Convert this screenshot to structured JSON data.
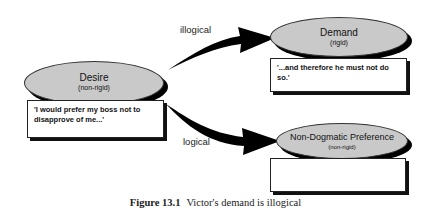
{
  "diagram": {
    "nodes": {
      "desire": {
        "title": "Desire",
        "subtitle": "(non-rigid)",
        "quote": "'I would prefer my boss not to disapprove of me...'"
      },
      "demand": {
        "title": "Demand",
        "subtitle": "(rigid)",
        "quote": "'...and therefore he must not do so.'"
      },
      "preference": {
        "title": "Non-Dogmatic Preference",
        "subtitle": "(non-rigid)",
        "quote": ""
      }
    },
    "edges": {
      "to_demand": {
        "label": "illogical"
      },
      "to_preference": {
        "label": "logical"
      }
    },
    "colors": {
      "ellipse_fill": "#c9c9c9",
      "arrow": "#000000",
      "box_fill": "#ffffff"
    }
  },
  "caption": {
    "figure_label": "Figure 13.1",
    "text": "Victor's demand is illogical"
  }
}
